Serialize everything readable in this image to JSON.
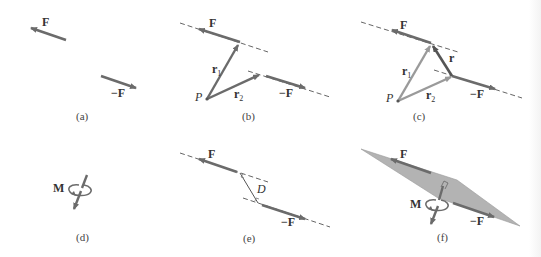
{
  "figure": {
    "colors": {
      "force_arrow": "#6b6b6b",
      "position_vector_b": "#6b6b6b",
      "position_vector_c": "#9a9a9a",
      "r_vector": "#555555",
      "dashed_line": "#666666",
      "plane_fill": "#b3b3b3",
      "text": "#333333"
    },
    "panels": [
      {
        "id": "a",
        "caption": "(a)",
        "labels": {
          "force": "F",
          "neg_force": "−F"
        }
      },
      {
        "id": "b",
        "caption": "(b)",
        "labels": {
          "force": "F",
          "neg_force": "−F",
          "point": "P",
          "r1": "r",
          "r1_sub": "1",
          "r2": "r",
          "r2_sub": "2"
        }
      },
      {
        "id": "c",
        "caption": "(c)",
        "labels": {
          "force": "F",
          "neg_force": "−F",
          "point": "P",
          "r1": "r",
          "r1_sub": "1",
          "r2": "r",
          "r2_sub": "2",
          "r": "r"
        }
      },
      {
        "id": "d",
        "caption": "(d)",
        "labels": {
          "moment": "M"
        }
      },
      {
        "id": "e",
        "caption": "(e)",
        "labels": {
          "force": "F",
          "neg_force": "−F",
          "distance": "D"
        }
      },
      {
        "id": "f",
        "caption": "(f)",
        "labels": {
          "force": "F",
          "neg_force": "−F",
          "moment": "M"
        }
      }
    ]
  }
}
